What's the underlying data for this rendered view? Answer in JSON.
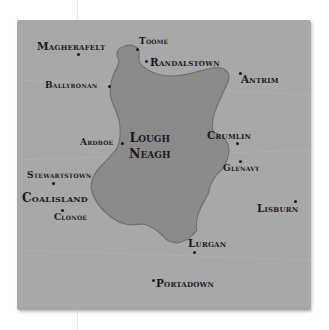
{
  "map": {
    "colors": {
      "land": "#a8a8a8",
      "lake": "#8a8a8a",
      "shore": "#6e6e6e",
      "text": "#1c1c1c"
    },
    "lake": {
      "name_line1": "Lough",
      "name_line2": "Neagh"
    },
    "places": [
      {
        "name": "Magherafelt"
      },
      {
        "name": "Toome"
      },
      {
        "name": "Randalstown"
      },
      {
        "name": "Antrim"
      },
      {
        "name": "Ballyronan"
      },
      {
        "name": "Ardboe"
      },
      {
        "name": "Crumlin"
      },
      {
        "name": "Glenavy"
      },
      {
        "name": "Stewartstown"
      },
      {
        "name": "Coalisland"
      },
      {
        "name": "Clonoe"
      },
      {
        "name": "Lisburn"
      },
      {
        "name": "Lurgan"
      },
      {
        "name": "Portadown"
      }
    ]
  }
}
